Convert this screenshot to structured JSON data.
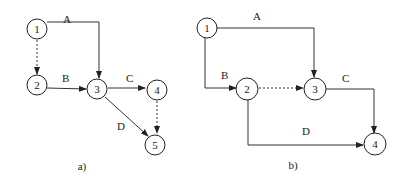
{
  "diagrams": [
    {
      "caption": "a)",
      "nodes": [
        {
          "id": "1",
          "label": "1"
        },
        {
          "id": "2",
          "label": "2"
        },
        {
          "id": "3",
          "label": "3"
        },
        {
          "id": "4",
          "label": "4"
        },
        {
          "id": "5",
          "label": "5"
        }
      ],
      "edges": [
        {
          "from": "1",
          "to": "3",
          "label": "A",
          "style": "solid"
        },
        {
          "from": "1",
          "to": "2",
          "label": "",
          "style": "dashed"
        },
        {
          "from": "2",
          "to": "3",
          "label": "B",
          "style": "solid"
        },
        {
          "from": "3",
          "to": "4",
          "label": "C",
          "style": "solid"
        },
        {
          "from": "3",
          "to": "5",
          "label": "D",
          "style": "solid"
        },
        {
          "from": "4",
          "to": "5",
          "label": "",
          "style": "dashed"
        }
      ]
    },
    {
      "caption": "b)",
      "nodes": [
        {
          "id": "1",
          "label": "1"
        },
        {
          "id": "2",
          "label": "2"
        },
        {
          "id": "3",
          "label": "3"
        },
        {
          "id": "4",
          "label": "4"
        }
      ],
      "edges": [
        {
          "from": "1",
          "to": "3",
          "label": "A",
          "style": "solid"
        },
        {
          "from": "1",
          "to": "2",
          "label": "B",
          "style": "solid"
        },
        {
          "from": "2",
          "to": "3",
          "label": "",
          "style": "dashed"
        },
        {
          "from": "3",
          "to": "4",
          "label": "C",
          "style": "solid"
        },
        {
          "from": "2",
          "to": "4",
          "label": "D",
          "style": "solid"
        }
      ]
    }
  ]
}
